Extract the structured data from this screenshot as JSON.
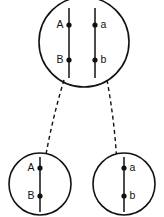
{
  "figure": {
    "background_color": "#ffffff",
    "stroke_color": "#111111"
  },
  "parent_cell": {
    "name": "parent-cell",
    "center": {
      "cx": 84,
      "cy": 42
    },
    "radius": 45,
    "chromosomes": [
      {
        "name": "chromosome-left",
        "x": 69,
        "top": 8,
        "bottom": 78,
        "loci": [
          {
            "label": "A",
            "y": 25,
            "side": "left"
          },
          {
            "label": "B",
            "y": 60,
            "side": "left"
          }
        ]
      },
      {
        "name": "chromosome-right",
        "x": 95,
        "top": 8,
        "bottom": 78,
        "loci": [
          {
            "label": "a",
            "y": 25,
            "side": "right"
          },
          {
            "label": "b",
            "y": 60,
            "side": "right"
          }
        ]
      }
    ]
  },
  "daughter_cells": [
    {
      "name": "daughter-cell-left",
      "center": {
        "cx": 40,
        "cy": 184
      },
      "radius": 31,
      "chromosome": {
        "name": "chromosome-AB",
        "x": 40,
        "top": 157,
        "bottom": 212,
        "loci": [
          {
            "label": "A",
            "y": 168,
            "side": "left"
          },
          {
            "label": "B",
            "y": 196,
            "side": "left"
          }
        ]
      }
    },
    {
      "name": "daughter-cell-right",
      "center": {
        "cx": 124,
        "cy": 184
      },
      "radius": 31,
      "chromosome": {
        "name": "chromosome-ab",
        "x": 124,
        "top": 157,
        "bottom": 212,
        "loci": [
          {
            "label": "a",
            "y": 168,
            "side": "right"
          },
          {
            "label": "b",
            "y": 196,
            "side": "right"
          }
        ]
      }
    }
  ],
  "migration_arrows": [
    {
      "name": "migration-arrow-left",
      "from": {
        "x": 64,
        "y": 80
      },
      "to": {
        "x": 44,
        "y": 166
      },
      "style": "dashed",
      "arrowhead": "down-left"
    },
    {
      "name": "migration-arrow-right",
      "from": {
        "x": 107,
        "y": 80
      },
      "to": {
        "x": 117,
        "y": 166
      },
      "style": "dashed",
      "arrowhead": "down-right"
    }
  ]
}
